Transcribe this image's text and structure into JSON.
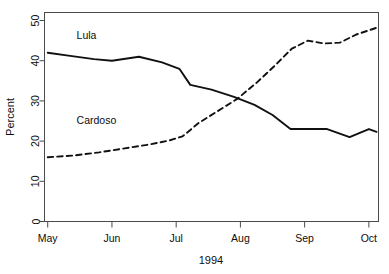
{
  "chart_data": {
    "type": "line",
    "title": "",
    "xlabel": "1994",
    "ylabel": "Percent",
    "ylim": [
      0,
      52
    ],
    "yticks": [
      0,
      10,
      20,
      30,
      40,
      50
    ],
    "ytick_labels": [
      "0",
      "10",
      "20",
      "30",
      "40",
      "50"
    ],
    "xticks": [
      0,
      1,
      2,
      3,
      4,
      5
    ],
    "xtick_labels": [
      "May",
      "Jun",
      "Jul",
      "Aug",
      "Sep",
      "Oct"
    ],
    "xlim": [
      -0.05,
      5.15
    ],
    "grid": false,
    "legend": "inline-annotations",
    "series": [
      {
        "name": "Lula",
        "style": "solid",
        "color": "#111111",
        "label_x": 0.45,
        "label_y": 45.5,
        "x": [
          0.0,
          0.35,
          0.72,
          1.0,
          1.42,
          1.78,
          2.05,
          2.22,
          2.55,
          2.9,
          3.22,
          3.5,
          3.78,
          4.0,
          4.35,
          4.7,
          5.0,
          5.12
        ],
        "y": [
          42.0,
          41.2,
          40.4,
          40.0,
          41.0,
          39.6,
          38.0,
          34.0,
          32.8,
          31.0,
          29.0,
          26.5,
          23.0,
          23.0,
          23.0,
          21.0,
          23.0,
          22.3
        ]
      },
      {
        "name": "Cardoso",
        "style": "dashed",
        "color": "#111111",
        "label_x": 0.45,
        "label_y": 24.2,
        "x": [
          0.0,
          0.4,
          0.8,
          1.2,
          1.6,
          1.9,
          2.1,
          2.35,
          2.65,
          2.95,
          3.25,
          3.55,
          3.8,
          4.05,
          4.3,
          4.55,
          4.8,
          5.12
        ],
        "y": [
          16.0,
          16.4,
          17.2,
          18.2,
          19.2,
          20.2,
          21.2,
          24.5,
          27.5,
          30.5,
          34.5,
          39.0,
          43.0,
          45.0,
          44.3,
          44.5,
          46.5,
          48.2
        ]
      }
    ]
  },
  "axes": {
    "y_label_text": "Percent",
    "x_label_text": "1994"
  }
}
